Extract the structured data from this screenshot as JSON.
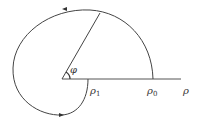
{
  "diagram": {
    "type": "polar-spiral",
    "labels": {
      "angle": "φ",
      "rho1": "ρ",
      "rho1_sub": "1",
      "rho0": "ρ",
      "rho0_sub": "0",
      "axis": "ρ"
    },
    "colors": {
      "stroke": "#333333",
      "background": "#ffffff"
    }
  }
}
